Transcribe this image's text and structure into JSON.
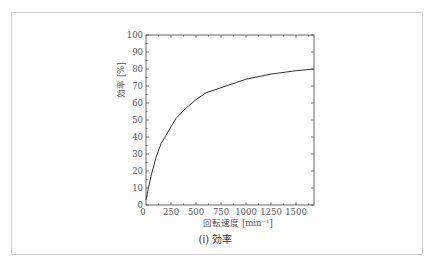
{
  "chart_data": {
    "type": "line",
    "title": "",
    "caption": "(i) 効率",
    "xlabel": "回転速度 [min⁻¹]",
    "ylabel": "効率 [%]",
    "xlim": [
      0,
      1680
    ],
    "ylim": [
      0,
      100
    ],
    "xticks": [
      0,
      250,
      500,
      750,
      1000,
      1250,
      1500
    ],
    "yticks": [
      0,
      10,
      20,
      30,
      40,
      50,
      60,
      70,
      80,
      90,
      100
    ],
    "grid": false,
    "series": [
      {
        "name": "効率",
        "x": [
          0,
          25,
          50,
          100,
          150,
          200,
          250,
          300,
          400,
          500,
          600,
          750,
          900,
          1000,
          1250,
          1500,
          1680
        ],
        "y": [
          3,
          10,
          17,
          28,
          36,
          41,
          46,
          51,
          57,
          62,
          66,
          69,
          72,
          74,
          77,
          79,
          80
        ]
      }
    ]
  }
}
